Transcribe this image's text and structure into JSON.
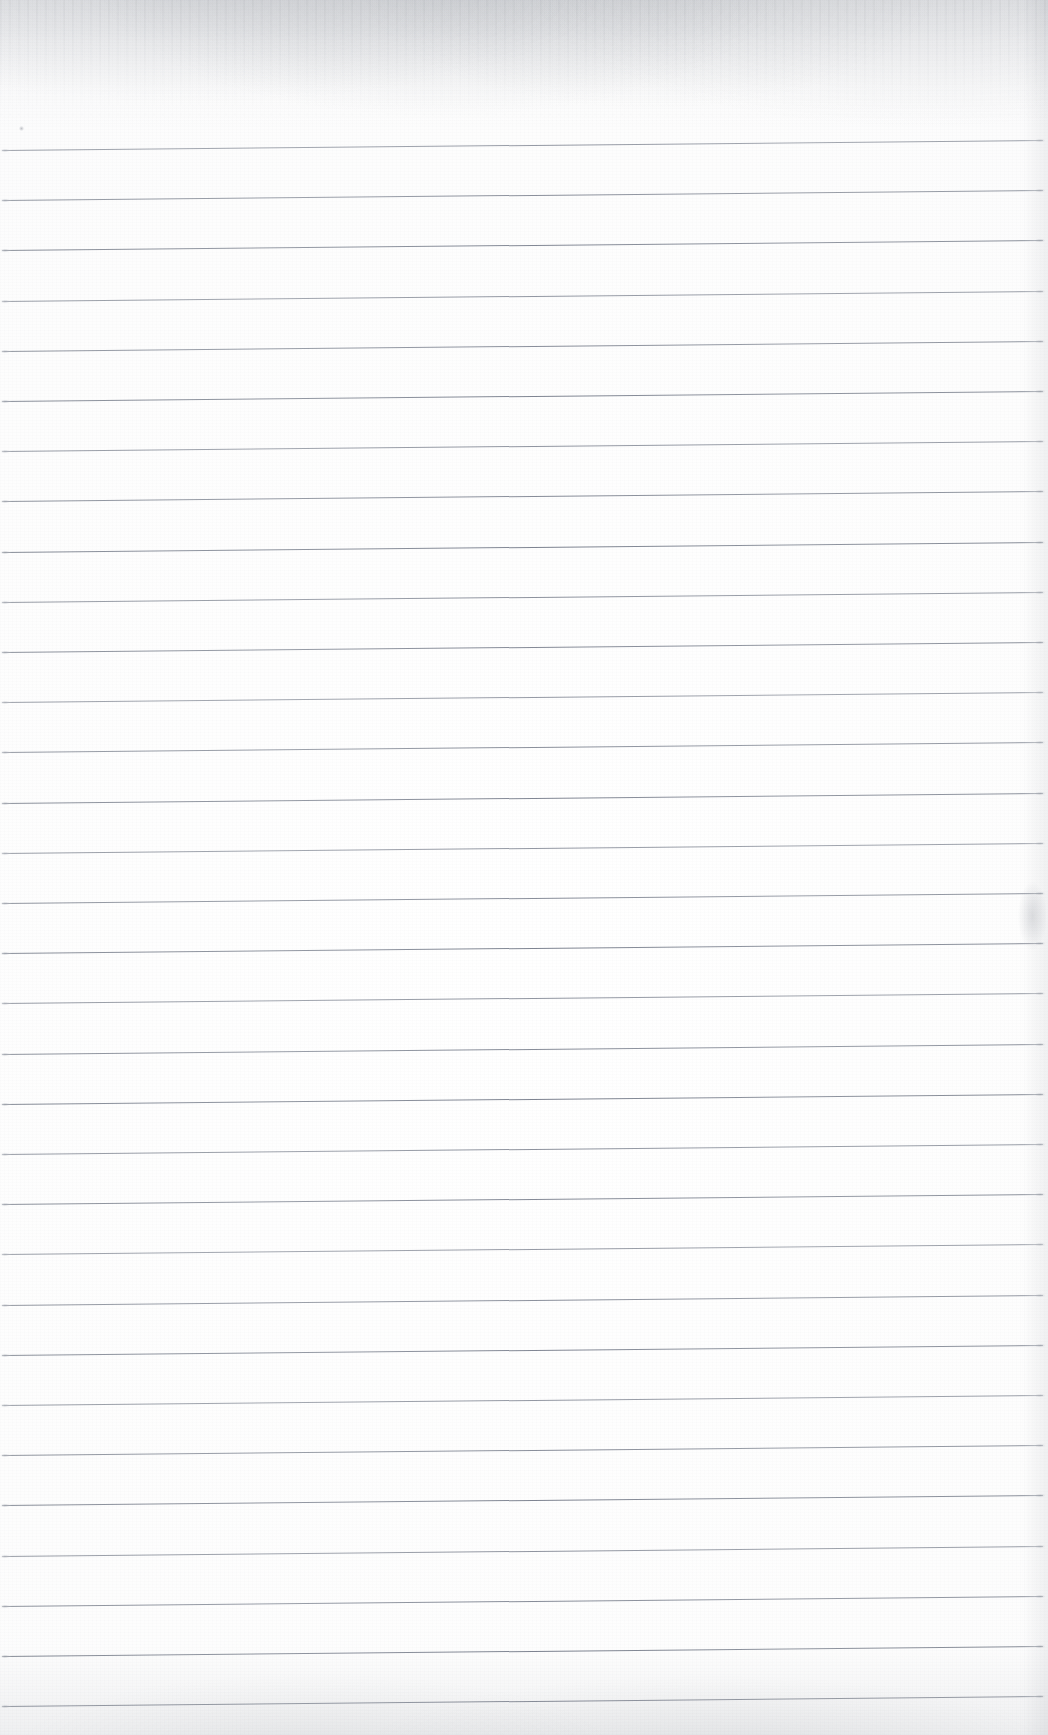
{
  "document": {
    "kind": "scanned-ruled-notebook-page",
    "title": "Blank ruled notebook page (scan)",
    "page_width": 1048,
    "page_height": 1735,
    "background_color": "#fdfdfd",
    "written_content": "",
    "has_text": false
  },
  "ruling": {
    "style": "wide-ruled-horizontal",
    "line_color": "#828894",
    "line_thickness_px": 1,
    "line_count": 32,
    "first_line_y": 150,
    "line_spacing_px": 50.2,
    "line_start_x": 2,
    "line_end_x": 1043,
    "skew_degrees": -0.55,
    "skew_note": "lines rise slightly toward the right edge",
    "line_y_positions": [
      150,
      200.2,
      250.4,
      300.6,
      350.8,
      401,
      451.2,
      501.4,
      551.6,
      601.8,
      652,
      702.2,
      752.4,
      802.6,
      852.8,
      903,
      953.2,
      1003.4,
      1053.6,
      1103.8,
      1154,
      1204.2,
      1254.4,
      1304.6,
      1354.8,
      1405,
      1455.2,
      1505.4,
      1555.6,
      1605.8,
      1656,
      1706.2
    ]
  },
  "margins": {
    "top_blank_height_px": 150,
    "left_margin_rule": false,
    "right_margin_rule": false
  },
  "scan_artifacts": {
    "top_smudge": "gray speckled band across the top ~130px of the sheet",
    "bottom_smudge": "faint gray mottling along the bottom edge",
    "right_edge_shading": "light gray shading down the right margin",
    "right_margin_spot": "small gray smudge near the right margin at y~900",
    "ink_speck": "tiny dark speck near x=20, y=128",
    "grain": "fine paper fibre texture across the whole page"
  }
}
